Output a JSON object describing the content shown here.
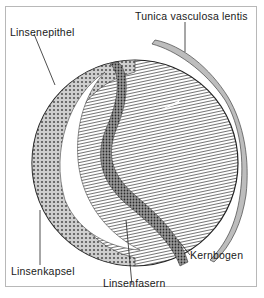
{
  "figure": {
    "labels": {
      "tunica": "Tunica vasculosa lentis",
      "epithel": "Linsenepithel",
      "kapsel": "Linsenkapsel",
      "fasern": "Linsenfasern",
      "kernbogen": "Kernbogen"
    }
  }
}
